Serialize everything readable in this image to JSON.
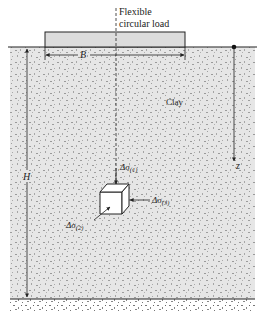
{
  "diagram": {
    "type": "soil-stress-diagram",
    "load_label_line1": "Flexible",
    "load_label_line2": "circular load",
    "width_label": "B",
    "depth_label": "H",
    "z_label": "z",
    "soil_label": "Clay",
    "stress_1": {
      "prefix": "Δσ",
      "sub": "(1)"
    },
    "stress_2": {
      "prefix": "Δσ",
      "sub": "(2)"
    },
    "stress_3": {
      "prefix": "Δσ",
      "sub": "(3)"
    },
    "colors": {
      "clay_fill": "#e6e6e6",
      "load_fill": "#dcdcdc",
      "line": "#222222",
      "speckle": "#9a9a9a",
      "cube_fill": "#ffffff"
    }
  }
}
